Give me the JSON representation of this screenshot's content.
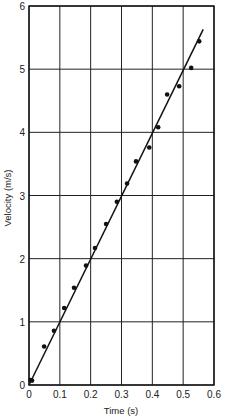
{
  "chart_data": {
    "type": "scatter",
    "title": "",
    "xlabel": "Time (s)",
    "ylabel": "Velocity (m/s)",
    "xlim": [
      0,
      0.6
    ],
    "ylim": [
      0,
      6
    ],
    "grid": true,
    "legend": null,
    "x_ticks": [
      "0",
      "0.1",
      "0.2",
      "0.3",
      "0.4",
      "0.5",
      "0.6"
    ],
    "y_ticks": [
      "0",
      "1",
      "2",
      "3",
      "4",
      "5",
      "6"
    ],
    "series": [
      {
        "name": "measured",
        "kind": "points",
        "x": [
          0.005,
          0.01,
          0.049,
          0.081,
          0.114,
          0.146,
          0.185,
          0.214,
          0.25,
          0.285,
          0.318,
          0.347,
          0.39,
          0.419,
          0.448,
          0.487,
          0.526,
          0.552
        ],
        "y": [
          0.08,
          0.07,
          0.61,
          0.86,
          1.22,
          1.54,
          1.89,
          2.17,
          2.55,
          2.9,
          3.19,
          3.54,
          3.76,
          4.08,
          4.6,
          4.73,
          5.02,
          5.44
        ]
      },
      {
        "name": "best-fit line",
        "kind": "line",
        "x": [
          0.0,
          0.565
        ],
        "y": [
          0.0,
          5.63
        ]
      }
    ]
  }
}
